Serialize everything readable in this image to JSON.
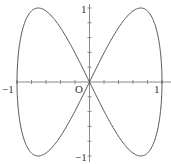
{
  "chart_data": {
    "type": "line",
    "title": "",
    "xlabel": "",
    "ylabel": "",
    "parametric": {
      "x": "sin(t)",
      "y": "sin(2t)",
      "t_range": [
        0,
        6.283185307
      ]
    },
    "xlim": [
      -1,
      1
    ],
    "ylim": [
      -1,
      1
    ],
    "grid": false,
    "x_ticks": [
      -1,
      -0.8,
      -0.6,
      -0.4,
      -0.2,
      0.2,
      0.4,
      0.6,
      0.8,
      1
    ],
    "y_ticks": [
      -1,
      -0.8,
      -0.6,
      -0.4,
      -0.2,
      0.2,
      0.4,
      0.6,
      0.8,
      1
    ],
    "labels": {
      "origin": "O",
      "x_neg": "−1",
      "x_pos": "1",
      "y_pos": "1",
      "y_neg": "−1"
    },
    "colors": {
      "curve": "#555555",
      "axis": "#888888"
    }
  }
}
